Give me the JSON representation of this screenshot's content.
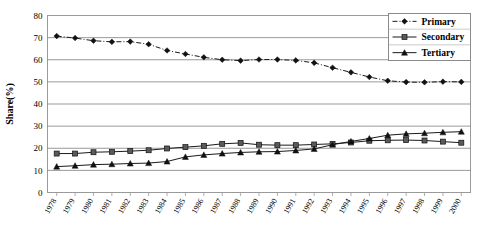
{
  "chart_data": {
    "type": "line",
    "title": "",
    "xlabel": "",
    "ylabel": "Share(%)",
    "ylim": [
      0,
      80
    ],
    "ytick_step": 10,
    "yticks": [
      "0",
      "10",
      "20",
      "30",
      "40",
      "50",
      "60",
      "70",
      "80"
    ],
    "grid": true,
    "legend_position": "top-right",
    "categories": [
      "1978",
      "1979",
      "1980",
      "1981",
      "1982",
      "1983",
      "1984",
      "1985",
      "1986",
      "1987",
      "1988",
      "1989",
      "1990",
      "1991",
      "1992",
      "1993",
      "1994",
      "1995",
      "1996",
      "1997",
      "1998",
      "1999",
      "2000"
    ],
    "series": [
      {
        "name": "Primary",
        "marker": "diamond",
        "linestyle": "dash-dot",
        "values": [
          70.7,
          69.8,
          68.6,
          68.1,
          68.2,
          67.0,
          64.2,
          62.6,
          61.1,
          60.0,
          59.6,
          60.1,
          60.1,
          59.7,
          58.6,
          56.4,
          54.3,
          52.2,
          50.5,
          49.9,
          49.8,
          50.1,
          50.0
        ]
      },
      {
        "name": "Secondary",
        "marker": "square",
        "linestyle": "solid",
        "values": [
          17.6,
          17.6,
          18.2,
          18.4,
          18.7,
          19.1,
          19.9,
          20.5,
          21.1,
          22.0,
          22.4,
          21.6,
          21.4,
          21.4,
          21.7,
          22.0,
          22.6,
          23.4,
          23.6,
          23.7,
          23.5,
          23.0,
          22.5
        ]
      },
      {
        "name": "Tertiary",
        "marker": "triangle",
        "linestyle": "solid",
        "values": [
          11.7,
          12.1,
          12.6,
          12.8,
          13.1,
          13.3,
          14.0,
          16.1,
          17.0,
          17.6,
          18.1,
          18.4,
          18.5,
          19.0,
          19.7,
          21.6,
          23.1,
          24.4,
          25.9,
          26.5,
          26.8,
          27.2,
          27.5
        ]
      }
    ]
  },
  "legend": {
    "items": [
      {
        "label": "Primary"
      },
      {
        "label": "Secondary"
      },
      {
        "label": "Tertiary"
      }
    ]
  }
}
